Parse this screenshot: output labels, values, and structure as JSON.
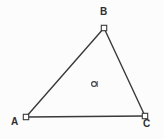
{
  "figure": {
    "name": "triangle-with-incenter",
    "width": 164,
    "height": 139,
    "background_color": "#fcfcfc",
    "stroke_color": "#3a3a3a",
    "marker_fill_color": "#ffffff",
    "label_color": "#2f2f2f",
    "stroke_width": 1.4
  },
  "chart_data": {
    "type": "diagram",
    "title": "",
    "xlabel": "",
    "ylabel": "",
    "points": [
      {
        "id": "A",
        "label": "A",
        "x": 26,
        "y": 117,
        "marker": "open-square",
        "label_dx": -12,
        "label_dy": 5
      },
      {
        "id": "B",
        "label": "B",
        "x": 104,
        "y": 28,
        "marker": "open-square",
        "label_dx": -1,
        "label_dy": -16
      },
      {
        "id": "C",
        "label": "C",
        "x": 145,
        "y": 116,
        "marker": "open-square",
        "label_dx": 1,
        "label_dy": 8
      },
      {
        "id": "I",
        "label": "I",
        "x": 94,
        "y": 84,
        "marker": "open-circle",
        "label_dx": 5,
        "label_dy": 1
      }
    ],
    "edges": [
      {
        "id": "AB",
        "from": "A",
        "to": "B"
      },
      {
        "id": "BC",
        "from": "B",
        "to": "C"
      },
      {
        "id": "CA",
        "from": "C",
        "to": "A"
      }
    ]
  },
  "labels": {
    "vertex_a": "A",
    "vertex_b": "B",
    "vertex_c": "C",
    "incenter": "I"
  },
  "icons": {
    "vertex_marker": "open-square-point-marker",
    "center_marker": "open-circle-point-marker"
  }
}
